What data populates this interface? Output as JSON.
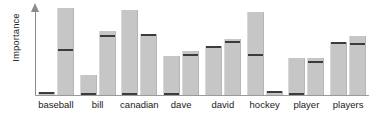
{
  "chart_data": {
    "type": "bar",
    "title": "",
    "subtitle": "",
    "xlabel": "",
    "ylabel": "Importance",
    "grid": false,
    "legend": false,
    "legend_position": "none",
    "axis_style": "arrow-y-axis-no-ticks",
    "ylim": [
      0,
      100
    ],
    "y_tick_labels": [],
    "x_tick_labels": [],
    "categories": [
      "baseball",
      "bill",
      "canadian",
      "dave",
      "david",
      "hockey",
      "player",
      "players"
    ],
    "series": [
      {
        "name": "bar-1",
        "values": [
          3,
          22,
          95,
          44,
          55,
          93,
          42,
          60
        ],
        "markers": [
          3,
          1,
          1,
          1,
          55,
          46,
          1,
          60
        ]
      },
      {
        "name": "bar-2",
        "values": [
          98,
          72,
          68,
          50,
          63,
          4,
          42,
          66
        ],
        "markers": [
          52,
          67,
          68,
          46,
          61,
          4,
          38,
          58
        ]
      }
    ],
    "colors": {
      "bar_fill": "#c6c6c6",
      "bar_marker": "#3c3c3c",
      "axis": "#9a9a9a",
      "text": "#1a1a1a",
      "background": "#ffffff"
    }
  },
  "axis": {
    "y_label": "Importance"
  }
}
